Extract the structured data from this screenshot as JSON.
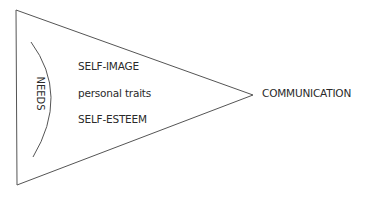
{
  "diagram": {
    "shape": "triangle-funnel",
    "line_color": "#555555",
    "inner_label": "NEEDS",
    "items": [
      {
        "label": "SELF-IMAGE"
      },
      {
        "label": "personal traits"
      },
      {
        "label": "SELF-ESTEEM"
      }
    ],
    "output_label": "COMMUNICATION"
  }
}
